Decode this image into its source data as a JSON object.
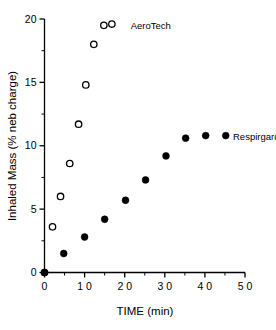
{
  "chart_data": {
    "type": "scatter",
    "title": "",
    "xlabel": "TIME (min)",
    "ylabel": "Inhaled Mass (% neb charge)",
    "xlim": [
      0,
      50
    ],
    "ylim": [
      0,
      20
    ],
    "xticks": [
      0,
      10,
      20,
      30,
      40,
      50
    ],
    "xticklabels": [
      "0",
      "1 0",
      "2 0",
      "3 0",
      "4 0",
      "5 0"
    ],
    "xminorticks": [
      5,
      15,
      25,
      35,
      45
    ],
    "yticks": [
      0,
      5,
      10,
      15,
      20
    ],
    "yticklabels": [
      "0",
      "5",
      "10",
      "15",
      "20"
    ],
    "yminorticks": [
      2.5,
      7.5,
      12.5,
      17.5
    ],
    "grid": false,
    "legend_position": "inline-annotation",
    "series": [
      {
        "name": "AeroTech",
        "marker": "open-circle",
        "color": "#000000",
        "label_x": 21.5,
        "label_y": 19.5,
        "points": [
          {
            "x": 0.0,
            "y": 0.0
          },
          {
            "x": 2.0,
            "y": 3.6
          },
          {
            "x": 4.0,
            "y": 6.0
          },
          {
            "x": 6.3,
            "y": 8.6
          },
          {
            "x": 8.5,
            "y": 11.7
          },
          {
            "x": 10.3,
            "y": 14.8
          },
          {
            "x": 12.3,
            "y": 18.0
          },
          {
            "x": 14.8,
            "y": 19.5
          },
          {
            "x": 16.8,
            "y": 19.6
          }
        ]
      },
      {
        "name": "Respirgard",
        "marker": "filled-circle",
        "color": "#000000",
        "label_x": 47.0,
        "label_y": 10.7,
        "points": [
          {
            "x": 0.0,
            "y": 0.0
          },
          {
            "x": 4.8,
            "y": 1.5
          },
          {
            "x": 10.0,
            "y": 2.8
          },
          {
            "x": 15.0,
            "y": 4.2
          },
          {
            "x": 20.2,
            "y": 5.7
          },
          {
            "x": 25.2,
            "y": 7.3
          },
          {
            "x": 30.3,
            "y": 9.2
          },
          {
            "x": 35.2,
            "y": 10.6
          },
          {
            "x": 40.2,
            "y": 10.8
          },
          {
            "x": 45.2,
            "y": 10.8
          }
        ]
      }
    ]
  },
  "figure": {
    "background": "#ffffff",
    "axis_color": "#000000"
  }
}
